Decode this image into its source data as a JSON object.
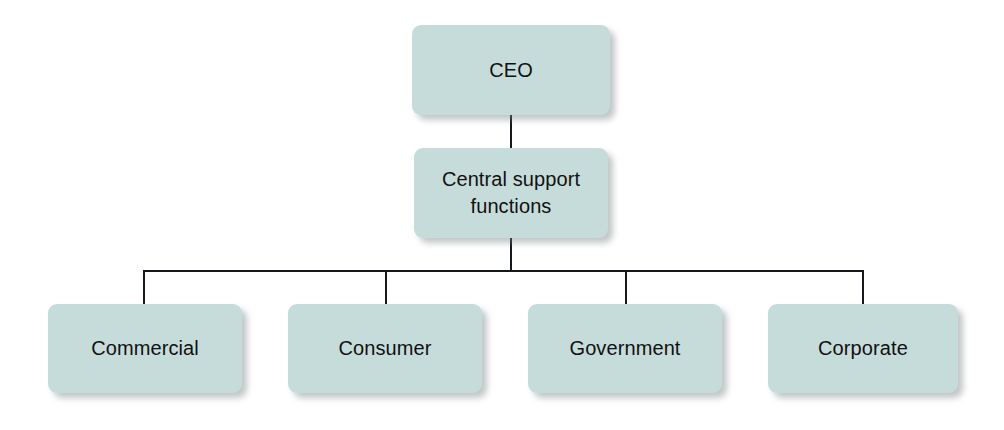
{
  "diagram": {
    "type": "org-chart",
    "background_color": "#ffffff",
    "node_fill_color": "#c6dcdb",
    "connector_color": "#14181c",
    "text_color": "#111111",
    "nodes": [
      {
        "id": "ceo",
        "label": "CEO",
        "level": 0,
        "x": 412,
        "y": 25,
        "width": 198,
        "height": 90
      },
      {
        "id": "central-support-functions",
        "label": "Central support\nfunctions",
        "level": 1,
        "x": 414,
        "y": 148,
        "width": 194,
        "height": 90
      },
      {
        "id": "commercial",
        "label": "Commercial",
        "level": 2,
        "x": 48,
        "y": 304,
        "width": 194,
        "height": 89
      },
      {
        "id": "consumer",
        "label": "Consumer",
        "level": 2,
        "x": 288,
        "y": 304,
        "width": 194,
        "height": 89
      },
      {
        "id": "government",
        "label": "Government",
        "level": 2,
        "x": 528,
        "y": 304,
        "width": 194,
        "height": 89
      },
      {
        "id": "corporate",
        "label": "Corporate",
        "level": 2,
        "x": 768,
        "y": 304,
        "width": 190,
        "height": 89
      }
    ],
    "connectors": [
      {
        "id": "ceo-to-central",
        "orientation": "v",
        "x": 510,
        "y": 115,
        "length": 33
      },
      {
        "id": "central-to-bus",
        "orientation": "v",
        "x": 510,
        "y": 238,
        "length": 34
      },
      {
        "id": "horizontal-bus",
        "orientation": "h",
        "x": 143,
        "y": 270,
        "length": 721
      },
      {
        "id": "bus-to-commercial",
        "orientation": "v",
        "x": 143,
        "y": 270,
        "length": 36
      },
      {
        "id": "bus-to-consumer",
        "orientation": "v",
        "x": 385,
        "y": 270,
        "length": 36
      },
      {
        "id": "bus-to-government",
        "orientation": "v",
        "x": 625,
        "y": 270,
        "length": 36
      },
      {
        "id": "bus-to-corporate",
        "orientation": "v",
        "x": 862,
        "y": 270,
        "length": 36
      }
    ]
  }
}
